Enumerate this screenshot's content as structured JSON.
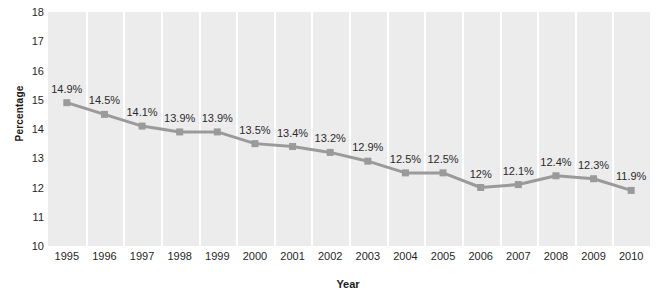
{
  "chart_data": {
    "type": "line",
    "title": "",
    "xlabel": "Year",
    "ylabel": "Percentage",
    "categories": [
      "1995",
      "1996",
      "1997",
      "1998",
      "1999",
      "2000",
      "2001",
      "2002",
      "2003",
      "2004",
      "2005",
      "2006",
      "2007",
      "2008",
      "2009",
      "2010"
    ],
    "values": [
      14.9,
      14.5,
      14.1,
      13.9,
      13.9,
      13.5,
      13.4,
      13.2,
      12.9,
      12.5,
      12.5,
      12.0,
      12.1,
      12.4,
      12.3,
      11.9
    ],
    "point_labels": [
      "14.9%",
      "14.5%",
      "14.1%",
      "13.9%",
      "13.9%",
      "13.5%",
      "13.4%",
      "13.2%",
      "12.9%",
      "12.5%",
      "12.5%",
      "12%",
      "12.1%",
      "12.4%",
      "12.3%",
      "11.9%"
    ],
    "ylim": [
      10,
      18
    ],
    "yticks": [
      18,
      17,
      16,
      15,
      14,
      13,
      12,
      11,
      10
    ],
    "ytick_labels": [
      "18",
      "17",
      "16",
      "15",
      "14",
      "13",
      "12",
      "11",
      "10"
    ],
    "grid": "vertical-only",
    "legend": "none",
    "series_color": "#9a9a9a",
    "marker": "square",
    "plot_background": "#ececec",
    "gridline_color": "#ffffff",
    "label_color": "#2b2b2b"
  },
  "watermark": {
    "text": "",
    "repeat": 18
  }
}
